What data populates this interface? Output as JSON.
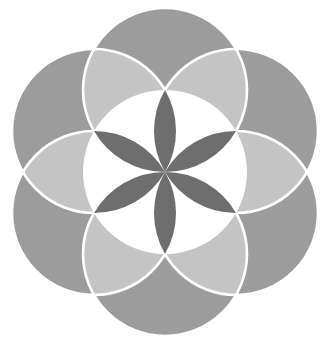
{
  "figure": {
    "geometry": {
      "cx": 165,
      "cy": 172,
      "r": 82,
      "outer_circle_angles_deg": [
        90,
        30,
        -30,
        -90,
        -150,
        150
      ],
      "petal_angles_deg": [
        90,
        30,
        -30,
        -90,
        -150,
        150
      ]
    },
    "colors": {
      "background": "#ffffff",
      "outer_circle": "#9c9c9c",
      "overlap_lens": "#c4c4c4",
      "center_circle": "#ffffff",
      "petal": "#6e6e6e",
      "stroke": "#ffffff"
    },
    "stroke_width": 2.6
  }
}
